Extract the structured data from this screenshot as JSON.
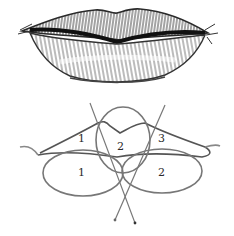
{
  "illustration": {
    "subject": "lips-drawing",
    "sketch": {
      "description": "pencil-shaded lips"
    },
    "diagram": {
      "description": "lip construction with overlapping ovals",
      "upper_lip_labels": [
        "1",
        "2",
        "3"
      ],
      "lower_lip_labels": [
        "1",
        "2"
      ]
    }
  },
  "colors": {
    "background": "#ffffff",
    "pencil_dark": "#1e1e1e",
    "pencil_mid": "#6a6a6a",
    "pencil_light": "#b5b5b5"
  }
}
